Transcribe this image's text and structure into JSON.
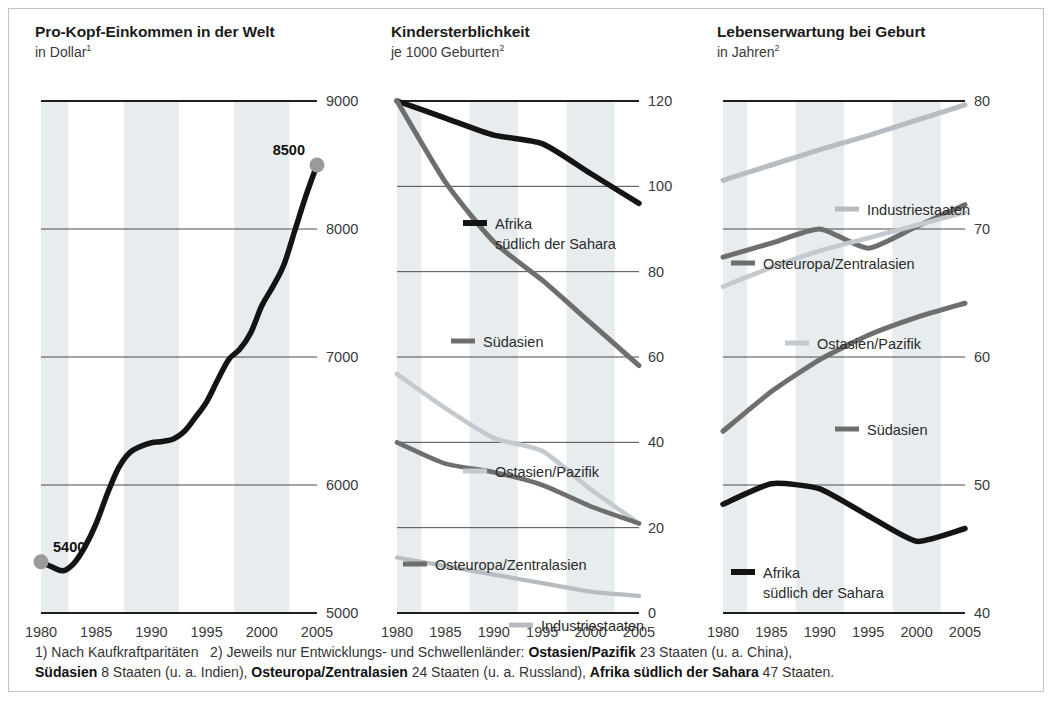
{
  "figure": {
    "footnote_line1_a": "1) Nach Kaufkraftparitäten",
    "footnote_line1_b": "2) Jeweils nur Entwicklungs- und Schwellenländer:",
    "footnote_oa": "Ostasien/Pazifik",
    "footnote_oa_rest": "23 Staaten (u. a. China),",
    "footnote_sa": "Südasien",
    "footnote_sa_rest": "8 Staaten (u. a. Indien),",
    "footnote_oe": "Osteuropa/Zentralasien",
    "footnote_oe_rest": "24 Staaten (u. a. Russland),",
    "footnote_af": "Afrika südlich der Sahara",
    "footnote_af_rest": "47 Staaten."
  },
  "colors": {
    "black": "#141414",
    "dark_gray": "#6e6e6e",
    "mid_gray": "#a9a9a9",
    "light_gray": "#c3c9cd",
    "band": "#dfe6ea",
    "gridline": "#2b2b2b",
    "marker": "#9a9a9a",
    "frame": "#b9c6d4"
  },
  "chart_data": [
    {
      "type": "line",
      "id": "pro-kopf-einkommen",
      "title": "Pro-Kopf-Einkommen in der Welt",
      "subtitle": "in Dollar",
      "subtitle_note": "1",
      "xlabel": "",
      "ylabel": "",
      "xlim": [
        1980,
        2005
      ],
      "ylim": [
        5000,
        9000
      ],
      "yticks": [
        5000,
        6000,
        7000,
        8000,
        9000
      ],
      "xticks": [
        1980,
        1985,
        1990,
        1995,
        2000,
        2005
      ],
      "grid": true,
      "legend": "none",
      "annotations": [
        {
          "text": "5400",
          "x": 1980,
          "y": 5400
        },
        {
          "text": "8500",
          "x": 2005,
          "y": 8500
        }
      ],
      "series": [
        {
          "name": "Welt",
          "color": "#141414",
          "x": [
            1980,
            1981,
            1982,
            1983,
            1984,
            1985,
            1986,
            1987,
            1988,
            1989,
            1990,
            1991,
            1992,
            1993,
            1994,
            1995,
            1996,
            1997,
            1998,
            1999,
            2000,
            2001,
            2002,
            2003,
            2004,
            2005
          ],
          "values": [
            5400,
            5360,
            5330,
            5390,
            5520,
            5700,
            5930,
            6130,
            6250,
            6300,
            6330,
            6340,
            6360,
            6420,
            6530,
            6650,
            6820,
            6980,
            7060,
            7190,
            7400,
            7550,
            7720,
            7990,
            8260,
            8500
          ]
        }
      ]
    },
    {
      "type": "line",
      "id": "kindersterblichkeit",
      "title": "Kindersterblichkeit",
      "subtitle": "je 1000 Geburten",
      "subtitle_note": "2",
      "xlabel": "",
      "ylabel": "",
      "xlim": [
        1980,
        2005
      ],
      "ylim": [
        0,
        120
      ],
      "yticks": [
        0,
        20,
        40,
        60,
        80,
        100,
        120
      ],
      "xticks": [
        1980,
        1985,
        1990,
        1995,
        2000,
        2005
      ],
      "grid": true,
      "legend": "inline",
      "series": [
        {
          "name": "Afrika südlich der Sahara",
          "label_line1": "Afrika",
          "label_line2": "südlich der Sahara",
          "color": "#141414",
          "x": [
            1980,
            1985,
            1990,
            1995,
            2000,
            2005
          ],
          "values": [
            120,
            116,
            112,
            110,
            103,
            96
          ]
        },
        {
          "name": "Südasien",
          "label_line1": "Südasien",
          "label_line2": "",
          "color": "#6e6e6e",
          "x": [
            1980,
            1985,
            1990,
            1995,
            2000,
            2005
          ],
          "values": [
            120,
            101,
            87,
            78,
            68,
            58
          ]
        },
        {
          "name": "Ostasien/Pazifik",
          "label_line1": "Ostasien/Pazifik",
          "label_line2": "",
          "color": "#c3c9cd",
          "x": [
            1980,
            1985,
            1990,
            1995,
            2000,
            2005
          ],
          "values": [
            56,
            48,
            41,
            38,
            29,
            21
          ]
        },
        {
          "name": "Osteuropa/Zentralasien",
          "label_line1": "Osteuropa/Zentralasien",
          "label_line2": "",
          "color": "#6e6e6e",
          "x": [
            1980,
            1985,
            1990,
            1995,
            2000,
            2005
          ],
          "values": [
            40,
            35,
            33,
            30,
            25,
            21
          ]
        },
        {
          "name": "Industriestaaten",
          "label_line1": "Industriestaaten",
          "label_line2": "",
          "color": "#b6bcc0",
          "x": [
            1980,
            1985,
            1990,
            1995,
            2000,
            2005
          ],
          "values": [
            13,
            11,
            9,
            7,
            5,
            4
          ]
        }
      ]
    },
    {
      "type": "line",
      "id": "lebenserwartung",
      "title": "Lebenserwartung bei Geburt",
      "subtitle": "in Jahren",
      "subtitle_note": "2",
      "xlabel": "",
      "ylabel": "",
      "xlim": [
        1980,
        2005
      ],
      "ylim": [
        40,
        80
      ],
      "yticks": [
        40,
        50,
        60,
        70,
        80
      ],
      "xticks": [
        1980,
        1985,
        1990,
        1995,
        2000,
        2005
      ],
      "grid": true,
      "legend": "inline",
      "series": [
        {
          "name": "Industriestaaten",
          "label_line1": "Industriestaaten",
          "label_line2": "",
          "color": "#b6bcc0",
          "x": [
            1980,
            1985,
            1990,
            1995,
            2000,
            2005
          ],
          "values": [
            73.8,
            75.0,
            76.2,
            77.3,
            78.5,
            79.7
          ]
        },
        {
          "name": "Osteuropa/Zentralasien",
          "label_line1": "Osteuropa/Zentralasien",
          "label_line2": "",
          "color": "#6e6e6e",
          "x": [
            1980,
            1985,
            1990,
            1995,
            2000,
            2005
          ],
          "values": [
            67.8,
            68.9,
            70.0,
            68.5,
            70.2,
            71.9
          ]
        },
        {
          "name": "Ostasien/Pazifik",
          "label_line1": "Ostasien/Pazifik",
          "label_line2": "",
          "color": "#c3c9cd",
          "x": [
            1980,
            1985,
            1990,
            1995,
            2000,
            2005
          ],
          "values": [
            65.5,
            67.0,
            68.3,
            69.3,
            70.3,
            71.3
          ]
        },
        {
          "name": "Südasien",
          "label_line1": "Südasien",
          "label_line2": "",
          "color": "#6e6e6e",
          "x": [
            1980,
            1985,
            1990,
            1995,
            2000,
            2005
          ],
          "values": [
            54.2,
            57.3,
            59.8,
            61.7,
            63.1,
            64.2
          ]
        },
        {
          "name": "Afrika südlich der Sahara",
          "label_line1": "Afrika",
          "label_line2": "südlich der Sahara",
          "color": "#141414",
          "x": [
            1980,
            1985,
            1990,
            1995,
            2000,
            2005
          ],
          "values": [
            48.5,
            50.1,
            49.7,
            47.6,
            45.6,
            46.6
          ]
        }
      ]
    }
  ]
}
